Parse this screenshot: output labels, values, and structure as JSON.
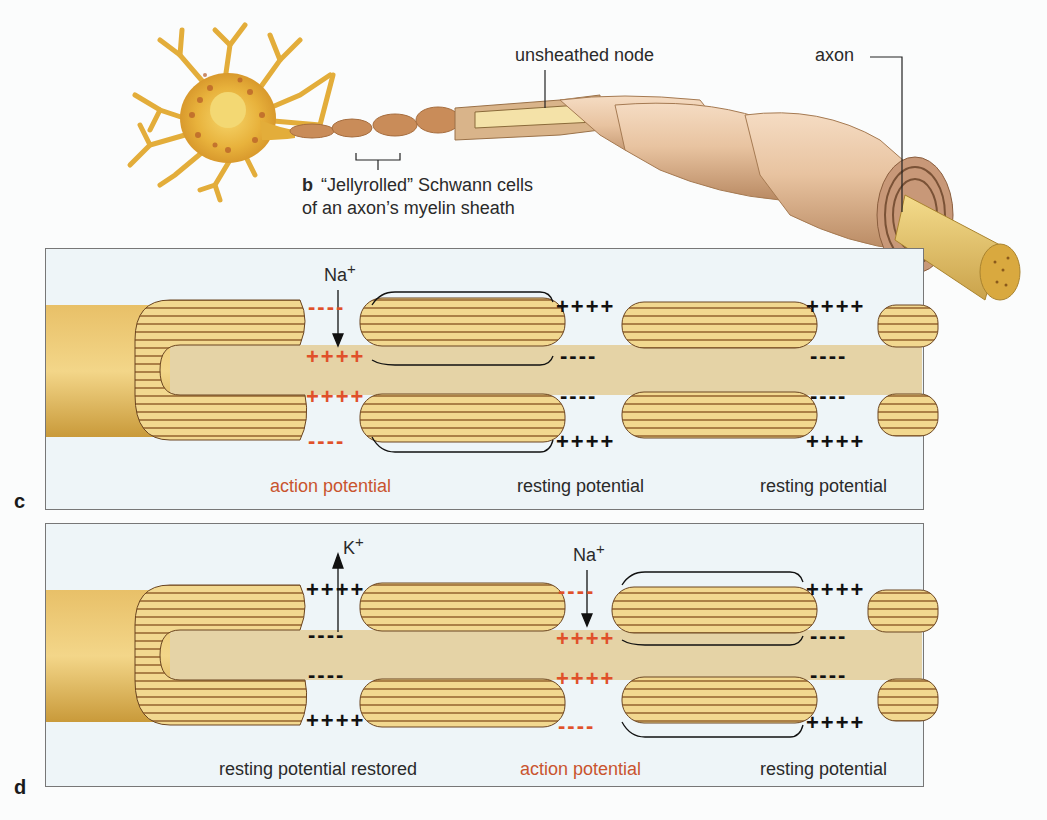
{
  "figure": {
    "panel_b": {
      "letter": "b",
      "caption_line1": "“Jellyrolled” Schwann cells",
      "caption_line2": "of an axon’s myelin sheath",
      "label_unsheathed_node": "unsheathed node",
      "label_axon": "axon"
    },
    "panel_c": {
      "letter": "c",
      "ion_label": "Na",
      "ion_charge": "+",
      "node1_state": "action potential",
      "node2_state": "resting potential",
      "node3_state": "resting potential",
      "node1_outer": "----",
      "node1_inner": "++++",
      "node2_outer": "++++",
      "node2_inner": "----",
      "node3_outer": "++++",
      "node3_inner": "----"
    },
    "panel_d": {
      "letter": "d",
      "ion_label_1": "K",
      "ion_charge_1": "+",
      "ion_label_2": "Na",
      "ion_charge_2": "+",
      "node1_state": "resting potential restored",
      "node2_state": "action potential",
      "node3_state": "resting potential",
      "node1_outer": "++++",
      "node1_inner": "----",
      "node2_outer": "----",
      "node2_inner": "++++",
      "node3_outer": "++++",
      "node3_inner": "----"
    },
    "colors": {
      "action_potential": "#c9542e",
      "charge_red": "#e0502a",
      "panel_bg": "#eef5f8",
      "myelin_light": "#f2d88f",
      "myelin_dark": "#8a5e2c",
      "axon_core": "#e5d3a6"
    }
  }
}
